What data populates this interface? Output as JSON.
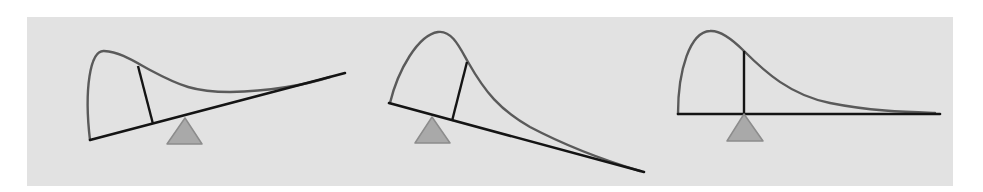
{
  "figure": {
    "background": {
      "x": 27,
      "y": 17,
      "width": 926,
      "height": 169,
      "color": "#e2e2e2"
    },
    "colors": {
      "curve": "#5a5a5a",
      "beam": "#141414",
      "marker_line": "#141414",
      "fulcrum_fill": "#a9a9a9",
      "fulcrum_stroke": "#8c8c8c"
    },
    "panels": [
      {
        "name": "panel-tilted-left-down",
        "curve_path": "M 90 140 C 84 90, 90 50, 104 51 C 120 52, 132 60, 150 70 C 180 86, 195 92, 230 92 C 270 91, 305 85, 330 77",
        "beam": {
          "x1": 90,
          "y1": 140,
          "x2": 345,
          "y2": 73
        },
        "marker_line": {
          "x1": 138,
          "y1": 66,
          "x2": 153,
          "y2": 124
        },
        "fulcrum": {
          "points": "185,118 167,144 202,144"
        }
      },
      {
        "name": "panel-tilted-right-down",
        "curve_path": "M 390 103 C 398 70, 418 35, 438 32 C 452 30, 460 48, 468 62 C 485 92, 500 110, 530 127 C 570 148, 610 162, 640 171",
        "beam": {
          "x1": 389,
          "y1": 103,
          "x2": 644,
          "y2": 172
        },
        "marker_line": {
          "x1": 467,
          "y1": 62,
          "x2": 452,
          "y2": 121
        },
        "fulcrum": {
          "points": "432,117 415,143 450,143"
        }
      },
      {
        "name": "panel-balanced",
        "curve_path": "M 678 114 C 678 70, 690 32, 710 31 C 722 30, 735 42, 744 51 C 765 72, 790 95, 830 103 C 870 111, 905 112, 935 113",
        "beam": {
          "x1": 678,
          "y1": 114,
          "x2": 940,
          "y2": 114
        },
        "marker_line": {
          "x1": 744,
          "y1": 51,
          "x2": 744,
          "y2": 114
        },
        "fulcrum": {
          "points": "744,114 727,141 763,141"
        }
      }
    ]
  }
}
